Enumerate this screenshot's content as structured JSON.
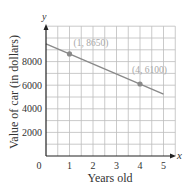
{
  "chart_data": {
    "type": "line",
    "title": "",
    "xlabel": "Years old",
    "ylabel": "Value of car (in dollars)",
    "x_axis_symbol": "x",
    "y_axis_symbol": "y",
    "xlim": [
      0,
      5.5
    ],
    "ylim": [
      0,
      11000
    ],
    "x_ticks": [
      0,
      1,
      2,
      3,
      4,
      5
    ],
    "x_tick_labels": [
      "0",
      "1",
      "2",
      "3",
      "4",
      "5"
    ],
    "y_ticks": [
      2000,
      4000,
      6000,
      8000
    ],
    "y_tick_labels": [
      "2000",
      "4000",
      "6000",
      "8000"
    ],
    "grid": true,
    "grid_x_step": 0.5,
    "grid_y_step": 1000,
    "series": [
      {
        "name": "value",
        "x": [
          0,
          5
        ],
        "y": [
          9500,
          5250
        ],
        "color": "#8a8a8a"
      }
    ],
    "points": [
      {
        "x": 1,
        "y": 8650,
        "label": "(1, 8650)"
      },
      {
        "x": 4,
        "y": 6100,
        "label": "(4, 6100)"
      }
    ],
    "colors": {
      "axis": "#222222",
      "grid": "#bdbdbd",
      "line": "#8a8a8a",
      "point": "#8a8a8a",
      "point_label": "#a8a8a8",
      "text": "#333333"
    }
  }
}
